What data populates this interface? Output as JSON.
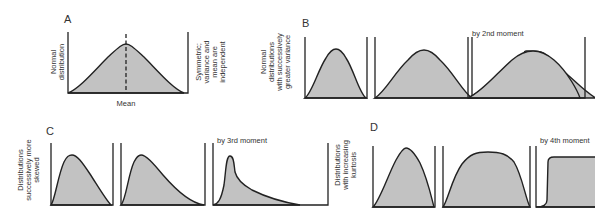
{
  "panels": {
    "A": {
      "letter": "A",
      "ylabel_lines": [
        "Normal",
        "distribution"
      ],
      "xlabel": "Mean",
      "side_note_lines": [
        "Symmetric;",
        "variance and",
        "mean are",
        "independent"
      ]
    },
    "B": {
      "letter": "B",
      "ylabel_lines": [
        "Normal",
        "distributions",
        "with successively",
        "greater variance"
      ],
      "caption": "by 2nd moment"
    },
    "C": {
      "letter": "C",
      "ylabel_lines": [
        "Distributions",
        "successively more",
        "skewed"
      ],
      "caption": "by 3rd moment"
    },
    "D": {
      "letter": "D",
      "ylabel_lines": [
        "Distributions",
        "with increasing",
        "kurtosis"
      ],
      "caption": "by 4th moment"
    }
  },
  "colors": {
    "fill": "#c2c2c2",
    "stroke": "#222222",
    "background": "#ffffff"
  }
}
